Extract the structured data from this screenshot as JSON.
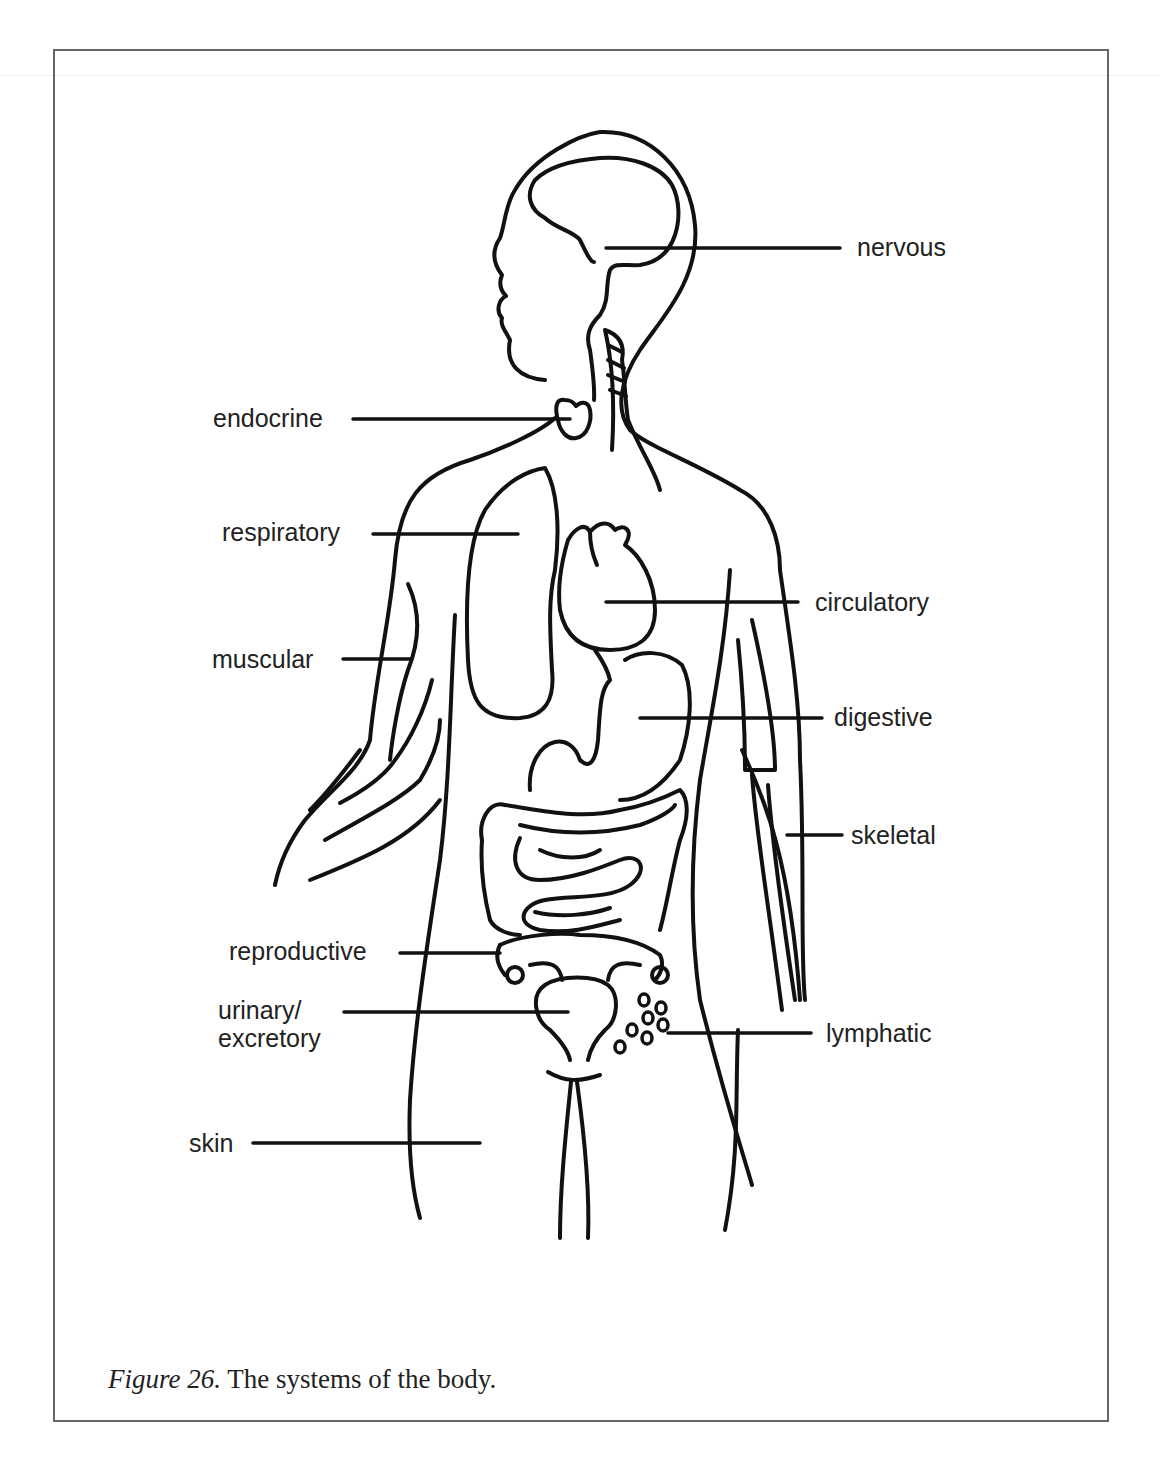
{
  "figure": {
    "caption_label": "Figure 26.",
    "caption_text": " The systems of the body."
  },
  "labels": {
    "nervous": "nervous",
    "endocrine": "endocrine",
    "respiratory": "respiratory",
    "circulatory": "circulatory",
    "muscular": "muscular",
    "digestive": "digestive",
    "skeletal": "skeletal",
    "reproductive": "reproductive",
    "urinary_line1": "urinary/",
    "urinary_line2": "excretory",
    "lymphatic": "lymphatic",
    "skin": "skin"
  },
  "colors": {
    "ink": "#111111",
    "frame": "#666666",
    "background": "#ffffff"
  }
}
